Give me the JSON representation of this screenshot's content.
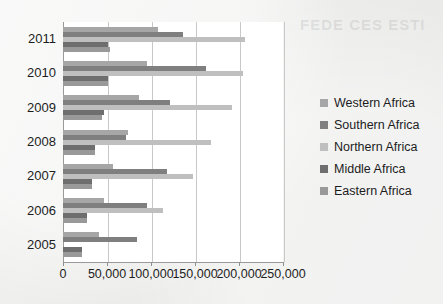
{
  "ghost_text": "FEDE CES ESTI",
  "chart_data": {
    "type": "bar",
    "orientation": "horizontal",
    "title": "",
    "subtitle": "",
    "xlabel": "",
    "ylabel": "",
    "categories": [
      "2011",
      "2010",
      "2009",
      "2008",
      "2007",
      "2006",
      "2005"
    ],
    "series": [
      {
        "name": "Western Africa",
        "color": "#a6a6a6",
        "values": [
          108000,
          95000,
          86000,
          74000,
          57000,
          47000,
          41000
        ]
      },
      {
        "name": "Southern Africa",
        "color": "#7f7f7f",
        "values": [
          136000,
          163000,
          122000,
          72000,
          118000,
          95000,
          84000
        ]
      },
      {
        "name": "Northern Africa",
        "color": "#bfbfbf",
        "values": [
          207000,
          205000,
          192000,
          168000,
          148000,
          114000,
          0
        ]
      },
      {
        "name": "Middle Africa",
        "color": "#6e6e6e",
        "values": [
          51000,
          51000,
          47000,
          36000,
          33000,
          27000,
          22000
        ]
      },
      {
        "name": "Eastern Africa",
        "color": "#999999",
        "values": [
          53000,
          51000,
          44000,
          36000,
          33000,
          27000,
          22000
        ]
      }
    ],
    "legend": {
      "position": "right",
      "entries": [
        "Western Africa",
        "Southern Africa",
        "Northern Africa",
        "Middle Africa",
        "Eastern Africa"
      ]
    },
    "xticks": [
      0,
      50000,
      100000,
      150000,
      200000,
      250000
    ],
    "xtick_labels": [
      "0",
      "50,000",
      "100,000",
      "150,000",
      "200,000",
      "250,000"
    ],
    "xlim": [
      0,
      250000
    ],
    "grid": true,
    "grid_axis": "x",
    "plot_background": "#ffffff",
    "figure_background": "#efefef"
  }
}
